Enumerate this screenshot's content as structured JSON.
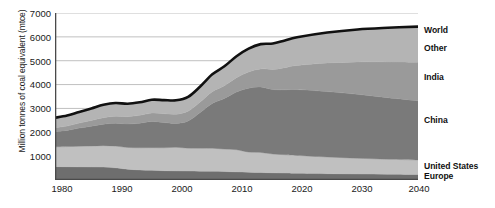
{
  "chart_data": {
    "type": "area",
    "title": "",
    "subtitle": "",
    "xlabel": "",
    "ylabel": "Million tonnes of coal equivalent (mtce)",
    "xlim": [
      1980,
      2040
    ],
    "ylim": [
      0,
      7000
    ],
    "grid": true,
    "stacked": true,
    "legend_position": "right",
    "y_ticks": [
      1000,
      2000,
      3000,
      4000,
      5000,
      6000,
      7000
    ],
    "y_tick_labels": [
      "1000",
      "2000",
      "3000",
      "4000",
      "5000",
      "6000",
      "7000"
    ],
    "x_ticks": [
      1980,
      1990,
      2000,
      2010,
      2020,
      2030,
      2040
    ],
    "x_tick_labels": [
      "1980",
      "1990",
      "2000",
      "2010",
      "2020",
      "2030",
      "2040"
    ],
    "x": [
      1980,
      1982,
      1984,
      1986,
      1988,
      1990,
      1992,
      1994,
      1996,
      1998,
      2000,
      2002,
      2004,
      2006,
      2008,
      2010,
      2012,
      2014,
      2016,
      2018,
      2020,
      2025,
      2030,
      2035,
      2040
    ],
    "series": [
      {
        "name": "Europe",
        "color": "#6e6e6e",
        "values": [
          560,
          555,
          550,
          545,
          540,
          510,
          450,
          420,
          405,
          390,
          380,
          375,
          370,
          365,
          355,
          340,
          330,
          315,
          300,
          290,
          280,
          265,
          250,
          240,
          230
        ]
      },
      {
        "name": "United States",
        "color": "#c0c0c0",
        "values": [
          830,
          845,
          865,
          880,
          900,
          910,
          915,
          930,
          950,
          960,
          990,
          960,
          960,
          965,
          940,
          930,
          840,
          840,
          790,
          770,
          750,
          700,
          660,
          630,
          610
        ]
      },
      {
        "name": "China",
        "color": "#7a7a7a",
        "values": [
          640,
          680,
          760,
          830,
          900,
          960,
          980,
          1030,
          1100,
          1060,
          1000,
          1140,
          1500,
          1880,
          2120,
          2420,
          2680,
          2740,
          2700,
          2720,
          2760,
          2740,
          2680,
          2580,
          2480
        ]
      },
      {
        "name": "India",
        "color": "#9a9a9a",
        "values": [
          160,
          180,
          210,
          240,
          270,
          290,
          310,
          330,
          350,
          370,
          390,
          410,
          440,
          490,
          540,
          600,
          680,
          760,
          840,
          930,
          1010,
          1200,
          1360,
          1500,
          1620
        ]
      },
      {
        "name": "Other",
        "color": "#b4b4b4",
        "values": [
          420,
          440,
          470,
          500,
          540,
          560,
          540,
          545,
          560,
          570,
          580,
          600,
          650,
          730,
          810,
          900,
          980,
          1040,
          1090,
          1140,
          1180,
          1275,
          1360,
          1430,
          1490
        ]
      }
    ],
    "total_line": {
      "name": "World",
      "color": "#111111",
      "values": [
        2610,
        2700,
        2855,
        2995,
        3150,
        3230,
        3195,
        3255,
        3365,
        3350,
        3340,
        3485,
        3920,
        4430,
        4765,
        5190,
        5510,
        5695,
        5720,
        5850,
        5980,
        6180,
        6310,
        6380,
        6430
      ]
    },
    "legend": [
      {
        "label": "World",
        "color": "#111111"
      },
      {
        "label": "Other",
        "color": "#b4b4b4"
      },
      {
        "label": "India",
        "color": "#9a9a9a"
      },
      {
        "label": "China",
        "color": "#7a7a7a"
      },
      {
        "label": "United States",
        "color": "#c0c0c0"
      },
      {
        "label": "Europe",
        "color": "#6e6e6e"
      }
    ]
  },
  "axis": {
    "y_label": "Million tonnes of coal equivalent (mtce)",
    "y_ticks": [
      "1000",
      "2000",
      "3000",
      "4000",
      "5000",
      "6000",
      "7000"
    ],
    "x_ticks": [
      "1980",
      "1990",
      "2000",
      "2010",
      "2020",
      "2030",
      "2040"
    ]
  },
  "legend": {
    "world": "World",
    "other": "Other",
    "india": "India",
    "china": "China",
    "united_states": "United States",
    "europe": "Europe"
  },
  "colors": {
    "world_line": "#111111",
    "other": "#b4b4b4",
    "india": "#9a9a9a",
    "china": "#7a7a7a",
    "united_states": "#c0c0c0",
    "europe": "#6e6e6e",
    "grid": "#b9b9b9",
    "axis": "#4a4a4a",
    "background": "#ffffff"
  }
}
